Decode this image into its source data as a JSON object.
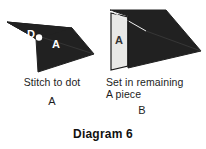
{
  "figure": {
    "caption": "Diagram 6",
    "background_color": "#ffffff",
    "dark_fill": "#212121",
    "light_fill": "#e8e8e6",
    "outline_color": "#1a1a1a",
    "label_light_color": "#ffffff",
    "label_dark_color": "#333333"
  },
  "steps": [
    {
      "key": "a",
      "part_letter": "A",
      "caption": "Stitch to dot",
      "shape": {
        "name": "stitched-unit-a",
        "fill": "dark",
        "labels": [
          {
            "name": "dot-label-d",
            "text": "D",
            "color": "#ffffff"
          },
          {
            "name": "piece-label-a",
            "text": "A",
            "color": "#ffffff"
          }
        ],
        "markers": [
          {
            "name": "stitch-dot",
            "text": "",
            "color": "#ffffff"
          }
        ]
      }
    },
    {
      "key": "b",
      "part_letter": "B",
      "caption_line_1": "Set in remaining",
      "caption_line_2": "A piece",
      "shape": {
        "name": "set-in-unit-b",
        "fill": "dark-with-light-inset",
        "labels": [
          {
            "name": "piece-label-a",
            "text": "A",
            "color": "#333333"
          }
        ]
      }
    }
  ]
}
